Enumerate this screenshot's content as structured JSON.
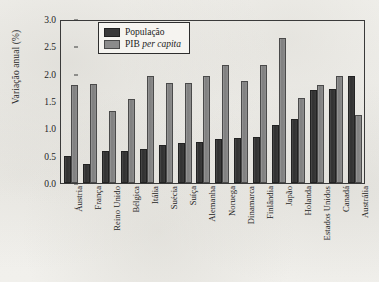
{
  "chart_data": {
    "type": "bar",
    "title": "",
    "xlabel": "",
    "ylabel": "Variação anual (%)",
    "ylim": [
      0.0,
      3.0
    ],
    "yticks": [
      "0.0",
      "0.5",
      "1.0",
      "1.5",
      "2.0",
      "2.5",
      "3.0"
    ],
    "ytick_values": [
      0.0,
      0.5,
      1.0,
      1.5,
      2.0,
      2.5,
      3.0
    ],
    "grid": false,
    "legend_position": "top-center",
    "categories": [
      "Áustria",
      "França",
      "Reino Unido",
      "Bélgica",
      "Itália",
      "Suécia",
      "Suíça",
      "Alemanha",
      "Noruega",
      "Dinamarca",
      "Finlândia",
      "Japão",
      "Holanda",
      "Estados Unidos",
      "Canadá",
      "Austrália"
    ],
    "series": [
      {
        "name": "População",
        "color": "#3a3a3a",
        "values": [
          0.5,
          0.35,
          0.58,
          0.58,
          0.62,
          0.7,
          0.73,
          0.75,
          0.8,
          0.82,
          0.85,
          1.07,
          1.18,
          1.7,
          1.72,
          1.95
        ]
      },
      {
        "name": "PIB per capita",
        "color": "#8b8b8b",
        "values": [
          1.8,
          1.82,
          1.32,
          1.53,
          1.95,
          1.83,
          1.83,
          1.96,
          2.16,
          1.87,
          2.15,
          2.66,
          1.55,
          1.8,
          1.95,
          1.25
        ]
      }
    ]
  },
  "legend": {
    "entries": [
      {
        "label": "População",
        "italic_part": ""
      },
      {
        "label": "PIB ",
        "italic_part": "per capita"
      }
    ]
  }
}
